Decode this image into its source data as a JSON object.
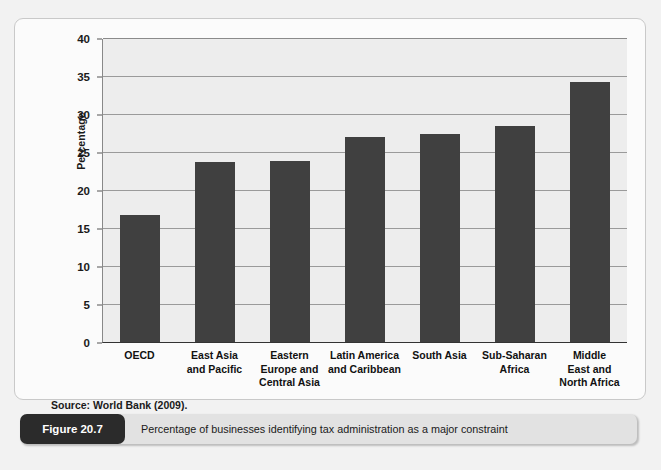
{
  "figure": {
    "number_label": "Figure 20.7",
    "caption": "Percentage of businesses identifying tax administration as a major constraint",
    "source": "Source: World Bank (2009)."
  },
  "chart_data": {
    "type": "bar",
    "title": "Percentage of businesses identifying tax administration as a major constraint",
    "xlabel": "",
    "ylabel": "Percentage",
    "ylim": [
      0,
      40
    ],
    "ytick_step": 5,
    "yticks": [
      0,
      5,
      10,
      15,
      20,
      25,
      30,
      35,
      40
    ],
    "grid": true,
    "legend": false,
    "bar_color": "#404040",
    "plot_background": "#ededed",
    "gridline_color": "#9a9a9a",
    "categories": [
      "OECD",
      "East Asia and Pacific",
      "Eastern Europe and Central Asia",
      "Latin America and Caribbean",
      "South Asia",
      "Sub-Saharan Africa",
      "Middle East and North Africa"
    ],
    "category_lines": [
      [
        "OECD"
      ],
      [
        "East Asia",
        "and Pacific"
      ],
      [
        "Eastern",
        "Europe and",
        "Central Asia"
      ],
      [
        "Latin America",
        "and Caribbean"
      ],
      [
        "South Asia"
      ],
      [
        "Sub-Saharan",
        "Africa"
      ],
      [
        "Middle",
        "East and",
        "North Africa"
      ]
    ],
    "values": [
      16.7,
      23.7,
      23.8,
      27.0,
      27.4,
      28.4,
      34.2
    ],
    "source": "World Bank (2009)."
  }
}
